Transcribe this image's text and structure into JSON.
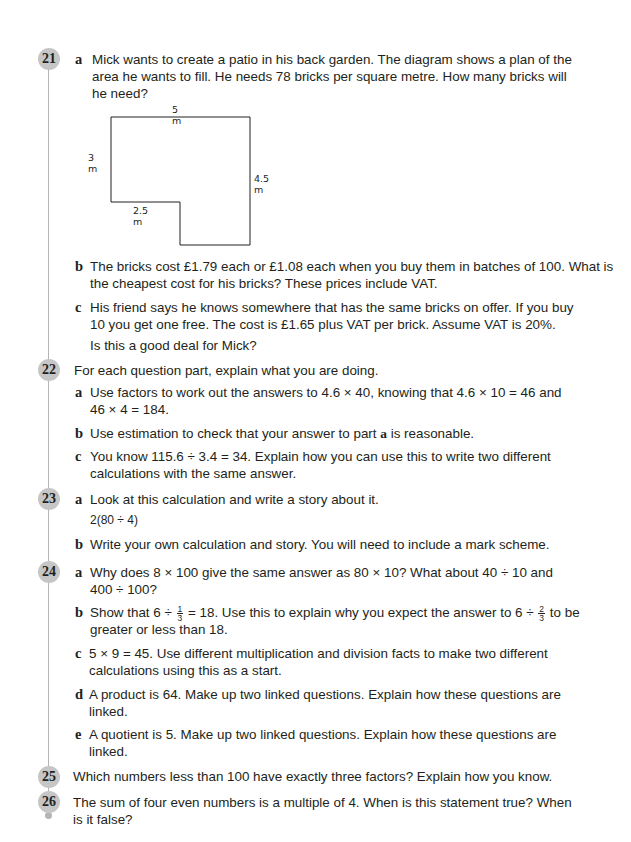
{
  "questions": {
    "q21": {
      "number": "21",
      "a": {
        "label": "a",
        "lines": [
          "Mick wants to create a patio in his back garden. The diagram shows a plan of the",
          "area he wants to fill. He needs 78 bricks per square metre. How many bricks will",
          "he need?"
        ]
      },
      "diagram": {
        "top": "5 m",
        "left": "3 m",
        "right": "4.5 m",
        "bottom_step": "2.5 m"
      },
      "b": {
        "label": "b",
        "lines": [
          "The bricks cost £1.79 each or £1.08 each when you buy them in batches of 100. What is",
          "the cheapest cost for his bricks? These prices include VAT."
        ]
      },
      "c": {
        "label": "c",
        "lines": [
          "His friend says he knows somewhere that has the same bricks on offer. If you buy",
          "10 you get one free. The cost is £1.65 plus VAT per brick. Assume VAT is 20%.",
          "Is this a good deal for Mick?"
        ]
      }
    },
    "q22": {
      "number": "22",
      "intro": "For each question part, explain what you are doing.",
      "a": {
        "label": "a",
        "lines": [
          "Use factors to work out the answers to 4.6 × 40, knowing that 4.6 × 10 = 46 and",
          "46 × 4 = 184."
        ]
      },
      "b": {
        "label": "b",
        "pre": "Use estimation to check that your answer to part ",
        "bold": "a",
        "post": " is reasonable."
      },
      "c": {
        "label": "c",
        "lines": [
          "You know 115.6 ÷ 3.4 = 34. Explain how you can use this to write two different",
          "calculations with the same answer."
        ]
      }
    },
    "q23": {
      "number": "23",
      "a": {
        "label": "a",
        "lines": [
          "Look at this calculation and write a story about it."
        ],
        "expression": "2(80 ÷ 4)"
      },
      "b": {
        "label": "b",
        "lines": [
          "Write your own calculation and story. You will need to include a mark scheme."
        ]
      }
    },
    "q24": {
      "number": "24",
      "a": {
        "label": "a",
        "lines": [
          "Why does 8 × 100 give the same answer as 80 × 10? What about 40 ÷ 10 and",
          "400 ÷ 100?"
        ]
      },
      "b": {
        "label": "b",
        "p1": "Show that 6 ÷ ",
        "f1_num": "1",
        "f1_den": "3",
        "p2": " = 18. Use this to explain why you expect the answer to 6 ÷ ",
        "f2_num": "2",
        "f2_den": "3",
        "p3": " to be",
        "line2": "greater or less than 18."
      },
      "c": {
        "label": "c",
        "lines": [
          "5 × 9 = 45. Use different multiplication and division facts to make two different",
          "calculations using this as a start."
        ]
      },
      "d": {
        "label": "d",
        "lines": [
          "A product is 64. Make up two linked questions. Explain how these questions are",
          "linked."
        ]
      },
      "e": {
        "label": "e",
        "lines": [
          "A quotient is 5. Make up two linked questions. Explain how these questions are",
          "linked."
        ]
      }
    },
    "q25": {
      "number": "25",
      "lines": [
        "Which numbers less than 100 have exactly three factors? Explain how you know."
      ]
    },
    "q26": {
      "number": "26",
      "lines": [
        "The sum of four even numbers is a multiple of 4. When is this statement true? When",
        "is it false?"
      ]
    }
  }
}
